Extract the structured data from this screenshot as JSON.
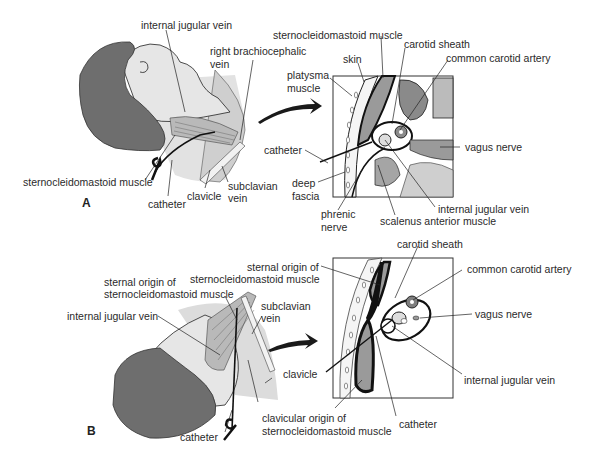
{
  "figure": {
    "panel_a": {
      "letter": "A",
      "illustration_labels": {
        "internal_jugular_vein": "internal jugular vein",
        "right_brachiocephalic_vein_l1": "right brachiocephalic",
        "right_brachiocephalic_vein_l2": "vein",
        "sternocleidomastoid_muscle": "sternocleidomastoid muscle",
        "catheter": "catheter",
        "clavicle": "clavicle",
        "subclavian_vein_l1": "subclavian",
        "subclavian_vein_l2": "vein"
      },
      "cross_section_labels": {
        "sternocleidomastoid_muscle": "sternocleidomastoid muscle",
        "skin": "skin",
        "carotid_sheath": "carotid sheath",
        "common_carotid_artery": "common carotid artery",
        "platysma_l1": "platysma",
        "platysma_l2": "muscle",
        "catheter": "catheter",
        "vagus_nerve": "vagus nerve",
        "deep_fascia_l1": "deep",
        "deep_fascia_l2": "fascia",
        "phrenic_nerve_l1": "phrenic",
        "phrenic_nerve_l2": "nerve",
        "internal_jugular_vein": "internal jugular vein",
        "scalenus_anterior_muscle": "scalenus anterior muscle"
      }
    },
    "panel_b": {
      "letter": "B",
      "illustration_labels": {
        "sternal_origin_l1": "sternal origin of",
        "sternal_origin_l2": "sternocleidomastoid muscle",
        "internal_jugular_vein": "internal jugular vein",
        "subclavian_vein_l1": "subclavian",
        "subclavian_vein_l2": "vein",
        "clavicle": "clavicle",
        "clavicular_origin_l1": "clavicular origin of",
        "clavicular_origin_l2": "sternocleidomastoid muscle",
        "catheter": "catheter"
      },
      "cross_section_labels": {
        "sternal_origin_l1": "sternal origin of",
        "sternal_origin_l2": "sternocleidomastoid muscle",
        "carotid_sheath": "carotid sheath",
        "common_carotid_artery": "common carotid artery",
        "vagus_nerve": "vagus nerve",
        "internal_jugular_vein": "internal jugular vein",
        "catheter": "catheter"
      }
    },
    "colors": {
      "hair": "#6e6e6e",
      "skin": "#d8d8d8",
      "muscle": "#8a8a8a",
      "outline": "#1a1a1a",
      "line": "#222222"
    }
  }
}
